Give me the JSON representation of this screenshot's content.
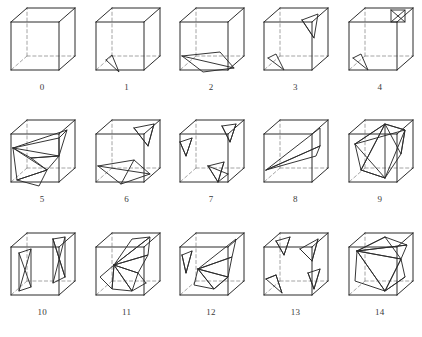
{
  "figure": {
    "type": "diagram",
    "rows": 3,
    "columns": 5,
    "total_cubes": 15,
    "line_colors": {
      "visible_edge": "#2b2b2b",
      "hidden_edge": "#9a9a9a",
      "triangle_edge": "#2b2b2b",
      "background": "#ffffff",
      "label": "#3a3a3a"
    }
  },
  "cubes": [
    {
      "label": "0",
      "polylines": []
    },
    {
      "label": "1",
      "polylines": [
        "18,60 31,72 24,55 18,60"
      ]
    },
    {
      "label": "2",
      "polylines": [
        "10,56 31,72 62,68 48,52 10,56",
        "10,56 62,68"
      ]
    },
    {
      "label": "3",
      "polylines": [
        "46,20 62,14 58,38 46,20",
        "46,20 58,38",
        "12,58 28,70 20,54 12,58"
      ]
    },
    {
      "label": "4",
      "polylines": [
        "50,10 64,10 64,22 50,22 50,10",
        "50,10 64,22",
        "64,10 50,22",
        "12,58 27,70 20,54 12,58"
      ]
    },
    {
      "label": "5",
      "polylines": [
        "10,36 56,26 64,18 10,36",
        "10,36 28,46 56,44 10,36",
        "28,46 56,44 44,58 28,46",
        "10,36 14,68 44,58 10,36",
        "14,68 36,74 44,58 14,68",
        "56,26 56,44",
        "56,44 64,18"
      ]
    },
    {
      "label": "6",
      "polylines": [
        "46,16 66,12 60,34 46,16",
        "46,16 60,34",
        "66,12 60,34",
        "10,54 33,72 62,62 46,48 10,54",
        "10,54 62,62",
        "33,72 46,48"
      ]
    },
    {
      "label": "7",
      "polylines": [
        "8,30 20,26 14,44 8,30",
        "8,30 14,44",
        "20,26 14,44",
        "50,14 64,12 58,30 50,14",
        "50,14 58,30",
        "64,12 58,30",
        "36,54 52,50 46,70 36,54",
        "36,54 46,70",
        "52,50 46,70",
        "36,54 56,62",
        "46,70 56,62"
      ]
    },
    {
      "label": "8",
      "polylines": [
        "10,58 64,34 64,16 10,58",
        "10,58 60,44 64,34",
        "10,58 64,34"
      ]
    },
    {
      "label": "9",
      "polylines": [
        "14,32 44,12 64,18 14,32",
        "14,32 20,58 44,12 14,32",
        "20,58 44,12 44,66 20,58",
        "44,12 64,18 60,42 44,12",
        "44,66 60,42 64,18 44,66",
        "20,58 44,66",
        "14,32 44,66"
      ]
    },
    {
      "label": "10",
      "polylines": [
        "16,28 28,24 28,62 16,66 16,28",
        "16,28 28,62",
        "16,66 28,24",
        "50,14 62,12 62,52 50,58 50,14",
        "50,14 62,52",
        "50,58 62,12",
        "50,14 62,52"
      ]
    },
    {
      "label": "11",
      "polylines": [
        "26,40 44,14 62,12 26,40",
        "26,40 62,12 60,30 26,40",
        "26,40 60,30 50,48 26,40",
        "26,40 50,48 44,66 26,40",
        "26,40 44,66 24,64 26,40",
        "26,40 24,64 12,52 26,40",
        "44,66 58,58",
        "50,48 58,58"
      ]
    },
    {
      "label": "12",
      "polylines": [
        "10,30 20,26 14,48 10,30",
        "10,30 14,48",
        "20,26 14,48",
        "26,44 60,32 64,14 26,44",
        "26,44 60,32 56,52 26,44",
        "26,44 56,52 42,64 26,44",
        "26,44 42,64 22,60 26,44",
        "42,64 56,52"
      ]
    },
    {
      "label": "13",
      "polylines": [
        "20,16 34,12 28,30 20,16",
        "20,16 28,30",
        "34,12 28,30",
        "44,24 62,14 56,36 44,24",
        "44,24 56,36",
        "62,14 56,36",
        "10,54 26,68 20,50 10,54",
        "10,54 20,50",
        "26,68 20,50",
        "52,48 64,44 58,64 52,48",
        "52,48 58,64",
        "64,44 58,64"
      ]
    },
    {
      "label": "14",
      "polylines": [
        "16,26 44,12 66,20 16,26",
        "16,26 66,20 60,34 16,26",
        "16,26 60,34 44,66 16,26",
        "16,26 44,66 14,56 16,26",
        "44,66 60,34 64,52 44,66",
        "44,12 60,34",
        "44,66 64,52",
        "16,26 44,12"
      ]
    }
  ]
}
